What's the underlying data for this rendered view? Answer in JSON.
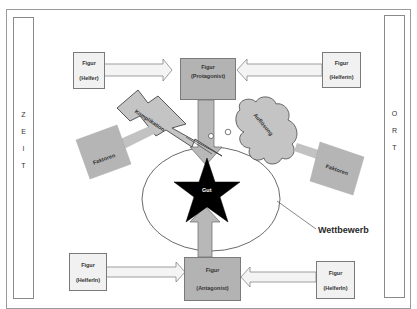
{
  "diagram": {
    "left_column": {
      "letters": [
        "Z",
        "E",
        "I",
        "T"
      ],
      "word": "ZEIT"
    },
    "right_column": {
      "letters": [
        "O",
        "R",
        "T"
      ],
      "word": "ORT"
    },
    "protagonist": {
      "line1": "Figur",
      "line2": "(Protagonist)"
    },
    "antagonist": {
      "line1": "Figur",
      "line2": "(Antagonist)"
    },
    "helper_top_left": {
      "line1": "Figur",
      "line2": "(Helfer)"
    },
    "helper_top_right": {
      "line1": "Figur",
      "line2": "(Helferin)"
    },
    "helper_bottom_left": {
      "line1": "Figur",
      "line2": "(HelferIn)"
    },
    "helper_bottom_right": {
      "line1": "Figur",
      "line2": "(HelferIn)"
    },
    "center_goal": "Gut",
    "complication": "Komplikation",
    "resolution": "Auflösung",
    "factors_left": "Faktoren",
    "factors_right": "Faktoren",
    "competition": "Wettbewerb"
  },
  "colors": {
    "box_dark": "#b3b3b3",
    "box_light": "#f1f1f1",
    "shape_gray": "#bdbdbd",
    "star": "#000000",
    "outline": "#555555"
  }
}
